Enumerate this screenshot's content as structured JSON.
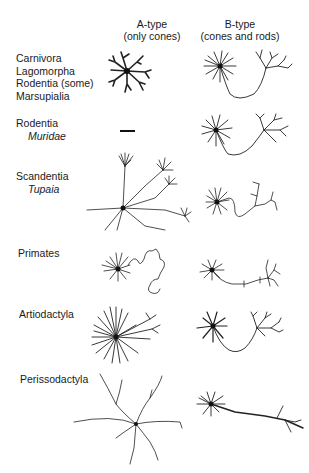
{
  "columns": [
    {
      "title": "A-type",
      "subtitle": "(only cones)"
    },
    {
      "title": "B-type",
      "subtitle": "(cones and rods)"
    }
  ],
  "rows": [
    {
      "lines": [
        "Carnivora",
        "Lagomorpha",
        "Rodentia (some)",
        "Marsupialia"
      ],
      "italic": []
    },
    {
      "lines": [
        "Rodentia"
      ],
      "italic": [
        "Muridae"
      ]
    },
    {
      "lines": [
        "Scandentia"
      ],
      "italic": [
        "Tupaia"
      ]
    },
    {
      "lines": [
        "Primates"
      ],
      "italic": []
    },
    {
      "lines": [
        "Artiodactyla"
      ],
      "italic": []
    },
    {
      "lines": [
        "Perissodactyla"
      ],
      "italic": []
    }
  ],
  "cells": {
    "row2_a_type": "absent (dash)"
  },
  "colors": {
    "ink": "#222222",
    "background": "#ffffff"
  }
}
